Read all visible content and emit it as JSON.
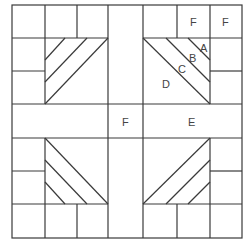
{
  "diagram": {
    "type": "quilt-block-pattern",
    "labels": {
      "A": "A",
      "B": "B",
      "C": "C",
      "D": "D",
      "E": "E",
      "F1": "F",
      "F2": "F",
      "F3": "F"
    },
    "colors": {
      "line": "#3a3a3a",
      "label": "#444444",
      "background": "#ffffff"
    }
  }
}
